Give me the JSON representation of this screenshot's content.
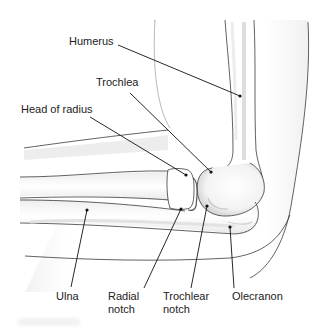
{
  "diagram": {
    "labels": {
      "humerus": "Humerus",
      "trochlea": "Trochlea",
      "head_of_radius": "Head of radius",
      "ulna": "Ulna",
      "radial_notch_line1": "Radial",
      "radial_notch_line2": "notch",
      "trochlear_notch_line1": "Trochlear",
      "trochlear_notch_line2": "notch",
      "olecranon": "Olecranon"
    },
    "colors": {
      "outline": "#3a3a3a",
      "bone_fill": "#ffffff",
      "shadow": "#d9d9d9",
      "leader": "#111111",
      "text": "#222222"
    }
  }
}
